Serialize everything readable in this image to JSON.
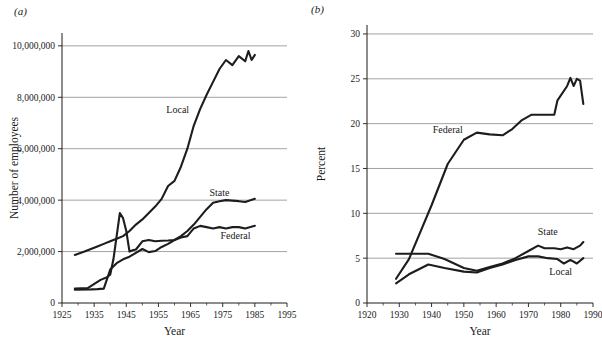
{
  "figure": {
    "panels": [
      {
        "tag": "(a)"
      },
      {
        "tag": "(b)"
      }
    ]
  },
  "chart_data": [
    {
      "panel": "(a)",
      "type": "line",
      "title": "",
      "xlabel": "Year",
      "ylabel": "Number of employees",
      "xlim": [
        1925,
        1995
      ],
      "ylim": [
        0,
        10500000
      ],
      "xticks": [
        1925,
        1935,
        1945,
        1955,
        1965,
        1975,
        1985,
        1995
      ],
      "xticklabels": [
        "1925",
        "1935",
        "1945",
        "1955",
        "1965",
        "1975",
        "1985",
        "1995"
      ],
      "xminorticks": [
        1930,
        1940,
        1950,
        1960,
        1970,
        1980,
        1990
      ],
      "yticks": [
        0,
        2000000,
        4000000,
        6000000,
        8000000,
        10000000
      ],
      "yticklabels": [
        "0",
        "2,000,000",
        "4,000,000",
        "6,000,000",
        "8,000,000",
        "10,000,000"
      ],
      "gridlines_at": [
        2000000,
        4000000,
        6000000,
        8000000,
        10000000
      ],
      "grid": true,
      "legend_position": "inline-labels",
      "annotations": [
        {
          "text": "Local",
          "x": 1961,
          "y": 7400000
        },
        {
          "text": "State",
          "x": 1974,
          "y": 4150000
        },
        {
          "text": "Federal",
          "x": 1979,
          "y": 2500000
        }
      ],
      "series": [
        {
          "name": "Local",
          "x": [
            1929,
            1932,
            1934,
            1936,
            1938,
            1940,
            1942,
            1944,
            1946,
            1948,
            1950,
            1952,
            1954,
            1956,
            1958,
            1960,
            1962,
            1964,
            1966,
            1968,
            1970,
            1972,
            1974,
            1976,
            1978,
            1980,
            1982,
            1983,
            1984,
            1985
          ],
          "values": [
            1870000,
            2000000,
            2100000,
            2200000,
            2300000,
            2400000,
            2500000,
            2600000,
            2800000,
            3050000,
            3250000,
            3500000,
            3750000,
            4050000,
            4550000,
            4750000,
            5300000,
            6000000,
            6900000,
            7550000,
            8100000,
            8600000,
            9100000,
            9450000,
            9250000,
            9600000,
            9400000,
            9800000,
            9450000,
            9650000
          ]
        },
        {
          "name": "State",
          "x": [
            1929,
            1934,
            1936,
            1938,
            1940,
            1942,
            1944,
            1946,
            1948,
            1950,
            1952,
            1954,
            1956,
            1958,
            1960,
            1962,
            1964,
            1966,
            1968,
            1970,
            1972,
            1974,
            1976,
            1978,
            1980,
            1982,
            1985
          ],
          "values": [
            520000,
            530000,
            540000,
            560000,
            1300000,
            1550000,
            1700000,
            1800000,
            1950000,
            2100000,
            1980000,
            2020000,
            2180000,
            2300000,
            2450000,
            2600000,
            2800000,
            3050000,
            3350000,
            3650000,
            3900000,
            3960000,
            4000000,
            3980000,
            3960000,
            3930000,
            4050000
          ]
        },
        {
          "name": "Federal",
          "x": [
            1929,
            1933,
            1937,
            1939,
            1940,
            1941,
            1942,
            1943,
            1944,
            1945,
            1946,
            1947,
            1948,
            1950,
            1952,
            1954,
            1956,
            1958,
            1960,
            1962,
            1964,
            1966,
            1968,
            1970,
            1972,
            1974,
            1976,
            1978,
            1980,
            1982,
            1985
          ],
          "values": [
            560000,
            580000,
            900000,
            1000000,
            1100000,
            1700000,
            2600000,
            3500000,
            3300000,
            2800000,
            2000000,
            2050000,
            2080000,
            2400000,
            2450000,
            2400000,
            2420000,
            2430000,
            2450000,
            2550000,
            2600000,
            2900000,
            3000000,
            2950000,
            2900000,
            2950000,
            2900000,
            2950000,
            2950000,
            2900000,
            3000000
          ]
        }
      ]
    },
    {
      "panel": "(b)",
      "type": "line",
      "title": "",
      "xlabel": "Year",
      "ylabel": "Percent",
      "xlim": [
        1920,
        1990
      ],
      "ylim": [
        0,
        31
      ],
      "xticks": [
        1920,
        1930,
        1940,
        1950,
        1960,
        1970,
        1980,
        1990
      ],
      "xticklabels": [
        "1920",
        "1930",
        "1940",
        "1950",
        "1960",
        "1970",
        "1980",
        "1990"
      ],
      "xminorticks": [
        1925,
        1935,
        1945,
        1955,
        1965,
        1975,
        1985
      ],
      "yticks": [
        0,
        5,
        10,
        15,
        20,
        25,
        30
      ],
      "yticklabels": [
        "0",
        "5",
        "10",
        "15",
        "20",
        "25",
        "30"
      ],
      "gridlines_at": [
        5,
        10,
        15,
        20,
        25,
        30
      ],
      "grid": true,
      "legend_position": "inline-labels",
      "annotations": [
        {
          "text": "Federal",
          "x": 1945,
          "y": 19.0
        },
        {
          "text": "State",
          "x": 1976,
          "y": 7.6
        },
        {
          "text": "Local",
          "x": 1980,
          "y": 3.1
        }
      ],
      "series": [
        {
          "name": "Federal",
          "x": [
            1929,
            1933,
            1940,
            1945,
            1950,
            1954,
            1958,
            1962,
            1965,
            1968,
            1971,
            1974,
            1978,
            1979,
            1982,
            1983,
            1984,
            1985,
            1986,
            1987
          ],
          "values": [
            2.7,
            4.9,
            10.9,
            15.5,
            18.2,
            19.0,
            18.8,
            18.7,
            19.4,
            20.4,
            21.0,
            21.0,
            21.0,
            22.6,
            24.2,
            25.1,
            24.2,
            25.0,
            24.8,
            22.2
          ]
        },
        {
          "name": "State",
          "x": [
            1929,
            1933,
            1939,
            1944,
            1950,
            1954,
            1958,
            1962,
            1966,
            1970,
            1973,
            1975,
            1978,
            1980,
            1982,
            1984,
            1986,
            1987
          ],
          "values": [
            5.5,
            5.5,
            5.5,
            4.9,
            3.9,
            3.6,
            4.0,
            4.4,
            5.0,
            5.8,
            6.4,
            6.1,
            6.1,
            6.0,
            6.2,
            6.0,
            6.4,
            6.8
          ]
        },
        {
          "name": "Local",
          "x": [
            1929,
            1933,
            1939,
            1944,
            1950,
            1954,
            1958,
            1962,
            1966,
            1970,
            1973,
            1976,
            1979,
            1981,
            1983,
            1985,
            1987
          ],
          "values": [
            2.2,
            3.2,
            4.3,
            3.9,
            3.5,
            3.4,
            3.9,
            4.3,
            4.8,
            5.2,
            5.2,
            5.0,
            4.9,
            4.4,
            4.8,
            4.4,
            5.0
          ]
        }
      ]
    }
  ]
}
